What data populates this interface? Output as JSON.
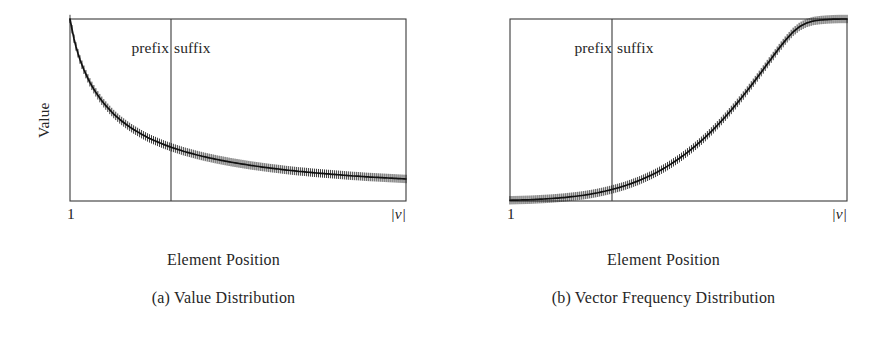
{
  "figure": {
    "background_color": "#ffffff",
    "ink_color": "#1a1a1a",
    "subfigures": [
      {
        "id": "a",
        "caption": "(a) Value Distribution",
        "axis_title": "Element Position",
        "y_axis_label": "Value",
        "x_tick_left": "1",
        "x_tick_right": "|v|",
        "region_prefix": "prefix",
        "region_suffix": "suffix"
      },
      {
        "id": "b",
        "caption": "(b) Vector Frequency Distribution",
        "axis_title": "Element Position",
        "y_axis_label": "VF",
        "x_tick_left": "1",
        "x_tick_right": "|v|",
        "region_prefix": "prefix",
        "region_suffix": "suffix"
      }
    ]
  },
  "chart_data": [
    {
      "type": "line",
      "id": "value-distribution",
      "title": "(a) Value Distribution",
      "xlabel": "Element Position",
      "ylabel": "Value",
      "xtick_labels": [
        "1",
        "|v|"
      ],
      "ytick_labels": [],
      "grid": false,
      "legend": null,
      "marker": "vertical-tick",
      "annotations": [
        {
          "text": "prefix",
          "region": "left-of-divider"
        },
        {
          "text": "suffix",
          "region": "right-of-divider"
        }
      ],
      "divider_x_fraction": 0.3006,
      "xlim": [
        0,
        1
      ],
      "ylim": [
        0,
        1
      ],
      "description": "Monotonically decreasing heavy-tailed (power-law / exponential) decay of element value with element position; dense vertical tick markers along the curve.",
      "x": [
        0.0,
        0.01,
        0.02,
        0.03,
        0.04,
        0.05,
        0.06,
        0.07,
        0.08,
        0.09,
        0.1,
        0.11,
        0.12,
        0.13,
        0.14,
        0.15,
        0.16,
        0.17,
        0.18,
        0.19,
        0.2,
        0.21,
        0.22,
        0.23,
        0.24,
        0.25,
        0.26,
        0.27,
        0.28,
        0.29,
        0.3,
        0.32,
        0.34,
        0.36,
        0.38,
        0.4,
        0.42,
        0.44,
        0.46,
        0.48,
        0.5,
        0.52,
        0.54,
        0.56,
        0.58,
        0.6,
        0.62,
        0.64,
        0.66,
        0.68,
        0.7,
        0.72,
        0.74,
        0.76,
        0.78,
        0.8,
        0.82,
        0.84,
        0.86,
        0.88,
        0.9,
        0.92,
        0.94,
        0.96,
        0.98,
        1.0
      ],
      "y": [
        1.0,
        0.905,
        0.833,
        0.775,
        0.727,
        0.686,
        0.649,
        0.617,
        0.588,
        0.562,
        0.538,
        0.517,
        0.497,
        0.478,
        0.461,
        0.445,
        0.431,
        0.417,
        0.404,
        0.392,
        0.381,
        0.37,
        0.36,
        0.35,
        0.341,
        0.333,
        0.325,
        0.317,
        0.31,
        0.303,
        0.296,
        0.284,
        0.272,
        0.262,
        0.252,
        0.243,
        0.235,
        0.227,
        0.22,
        0.213,
        0.207,
        0.201,
        0.195,
        0.19,
        0.185,
        0.18,
        0.176,
        0.171,
        0.167,
        0.163,
        0.16,
        0.156,
        0.153,
        0.15,
        0.147,
        0.144,
        0.141,
        0.138,
        0.136,
        0.133,
        0.131,
        0.129,
        0.127,
        0.125,
        0.123,
        0.121
      ]
    },
    {
      "type": "line",
      "id": "vector-frequency-distribution",
      "title": "(b) Vector Frequency Distribution",
      "xlabel": "Element Position",
      "ylabel": "VF",
      "xtick_labels": [
        "1",
        "|v|"
      ],
      "ytick_labels": [],
      "grid": false,
      "legend": null,
      "marker": "vertical-tick",
      "annotations": [
        {
          "text": "prefix",
          "region": "left-of-divider"
        },
        {
          "text": "suffix",
          "region": "right-of-divider"
        }
      ],
      "divider_x_fraction": 0.3036,
      "xlim": [
        0,
        1
      ],
      "ylim": [
        0,
        1
      ],
      "description": "Monotonically increasing convex (exponential) growth of vector frequency with element position; near zero across the prefix, rising steeply through the suffix to the maximum at |v|.",
      "x": [
        0.0,
        0.02,
        0.04,
        0.06,
        0.08,
        0.1,
        0.12,
        0.14,
        0.16,
        0.18,
        0.2,
        0.22,
        0.24,
        0.26,
        0.28,
        0.3,
        0.32,
        0.34,
        0.36,
        0.38,
        0.4,
        0.42,
        0.44,
        0.46,
        0.48,
        0.5,
        0.52,
        0.54,
        0.56,
        0.58,
        0.6,
        0.62,
        0.64,
        0.66,
        0.68,
        0.7,
        0.72,
        0.74,
        0.76,
        0.78,
        0.8,
        0.82,
        0.84,
        0.86,
        0.88,
        0.9,
        0.92,
        0.94,
        0.96,
        0.98,
        1.0
      ],
      "y": [
        0.004,
        0.005,
        0.006,
        0.007,
        0.009,
        0.011,
        0.013,
        0.016,
        0.019,
        0.023,
        0.027,
        0.032,
        0.038,
        0.045,
        0.053,
        0.062,
        0.072,
        0.083,
        0.096,
        0.11,
        0.126,
        0.143,
        0.162,
        0.183,
        0.206,
        0.231,
        0.258,
        0.287,
        0.318,
        0.351,
        0.387,
        0.425,
        0.465,
        0.507,
        0.551,
        0.597,
        0.645,
        0.694,
        0.744,
        0.794,
        0.843,
        0.889,
        0.929,
        0.959,
        0.978,
        0.989,
        0.994,
        0.997,
        0.999,
        1.0,
        1.0
      ]
    }
  ]
}
